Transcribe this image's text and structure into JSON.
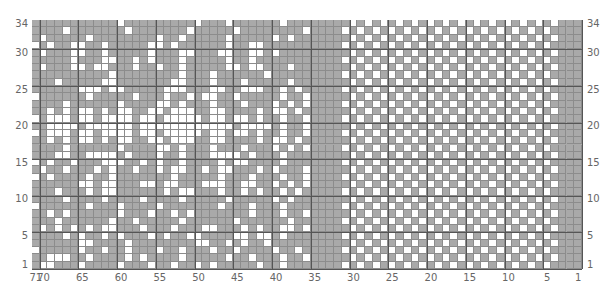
{
  "chart": {
    "columns": 71,
    "rows": 34,
    "colors": {
      "background": "#a9a9a9",
      "contrast": "#ffffff",
      "grid": "#8c8c8c",
      "major_grid": "#555555",
      "labels": "#666666"
    },
    "left_axis_labels": [
      "34",
      "30",
      "25",
      "20",
      "15",
      "10",
      "5",
      "1"
    ],
    "right_axis_labels": [
      "34",
      "30",
      "25",
      "20",
      "15",
      "10",
      "5",
      "1"
    ],
    "bottom_axis_labels": [
      "71",
      "70",
      "65",
      "60",
      "55",
      "50",
      "45",
      "40",
      "35",
      "30",
      "25",
      "20",
      "15",
      "10",
      "5",
      "1"
    ],
    "sections": [
      {
        "name": "snowflake-motif",
        "from_col": 71,
        "to_col": 36
      },
      {
        "name": "solid-border",
        "from_col": 35,
        "to_col": 32
      },
      {
        "name": "checkerboard",
        "from_col": 31,
        "to_col": 4,
        "rule": "white when (row + col) is even"
      },
      {
        "name": "solid-edge",
        "from_col": 3,
        "to_col": 1
      }
    ],
    "motif_rows_top_to_bottom": [
      "...........o.........o...o......o.....",
      "....o.......o.......o.....o........o..",
      ".o.....o........o..o.....o.....o.o....",
      "o.o..oo..o.....oo.o......o..oo.......o",
      ".o...oo..o.....o...oo...oo..oo.o......",
      ".....o...oo..o.o...o.....o..o........o",
      ".o...oo.oo...o..o..o.....oo.oo...o..o.",
      "..........o........o...o......o.......",
      "...o.....oo.......oo...o...o.....o....",
      "......ooo.oo.....ooo...oo..ooo..o.o...",
      "o......o.....o...o..o.oo..o.....o..o..",
      "....o......o....oo.o...o...o...o.o.o..",
      "..o.o.oo.o.oo..oo.ooo..oo....o.oo.o...",
      "o.ooo.oo.oooo.oo.ooooo.oo.oo.o..o..o..",
      "..oooo.oooooo.oooooooooooo.oooo.o..o..",
      "o.ooo.oo.oooo.oo.ooooo.oo.oo.o..o..o..",
      "..o.o.oo.o.oo..oo.ooo..oo....o.oo.o...",
      "....o......o....oo.o...o...o...o.o.o..",
      "...oo..oooo.o...o..o...oooo.o...o.....",
      "o.o..o...ooo..o.o..o....o.oo....o.....",
      ".o..o...o.o..o..o.oo..o.oo...o.o...o..",
      "o.o....o..o.......o.....o...o...o..o..",
      "......oo.oo...oo.oo...ooo..oo..o.o.o..",
      "...o...o.oo......o.oo...o..o.o..o.o...",
      "....o....o....o....o.....o.....o.o..o.",
      "o......o...o....o.......o...o...o.....",
      "..o.o......o...o..o.o.......o...o..o..",
      "...o......o..o.....o......o......o....",
      ".o.o.o.o.oo...o...o...oo...o.o..oo.o..",
      "....o.o..o.o...o.o..oo....oo.oo.o.....",
      "......oo....o........oo..o.o..o.....o.",
      "o.....o..o..o...o..o...o..o....o..o...",
      "..ooo..o....o.o....o.....o..o...o..o..",
      ".oo...o....o...o..o..o.o.....o..o.....",
      "o.o.oo.o.....o..oo...o...o..o..oo.o.o."
    ]
  }
}
